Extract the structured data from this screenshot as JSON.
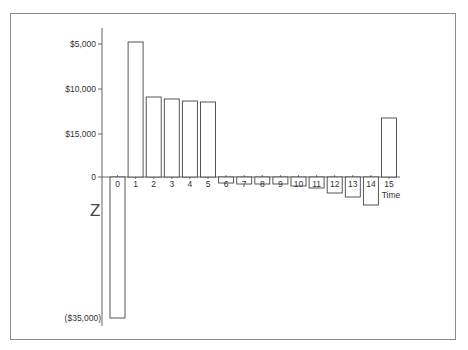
{
  "chart_data": {
    "type": "bar",
    "title": "",
    "xlabel": "Time",
    "ylabel": "",
    "categories": [
      "0",
      "1",
      "2",
      "3",
      "4",
      "5",
      "6",
      "7",
      "8",
      "9",
      "10",
      "11",
      "12",
      "13",
      "14",
      "15"
    ],
    "values": [
      -16000,
      15250,
      9050,
      8800,
      8600,
      8450,
      -700,
      -800,
      -800,
      -800,
      -1000,
      -1250,
      -1800,
      -2250,
      -3150,
      6650
    ],
    "pixel_heights_from_zero": [
      -141,
      135,
      80,
      78,
      76,
      75,
      -6,
      -7,
      -7,
      -7,
      -9,
      -11,
      -16,
      -20,
      -28,
      59
    ],
    "y_tick_labels": [
      "$5,000",
      "$10,000",
      "$15,000",
      "0",
      "($35,000)"
    ],
    "y_axis_break_marker": "Z",
    "grid": false,
    "legend": null,
    "note": "Schematic cash-flow diagram; y tick labels reproduced as printed"
  },
  "axis": {
    "zero_label": "0",
    "ticks": [
      {
        "label": "$5,000",
        "y": 44
      },
      {
        "label": "$10,000",
        "y": 89
      },
      {
        "label": "$15,000",
        "y": 134
      },
      {
        "label": "0",
        "y": 177
      }
    ],
    "bottom_label": "($35,000)",
    "x_title": "Time",
    "break_glyph": "Z"
  },
  "colors": {
    "frame": "#8a8a8a",
    "axis": "#555555",
    "bar_stroke": "#444444",
    "bar_fill": "#ffffff",
    "text": "#333333"
  }
}
